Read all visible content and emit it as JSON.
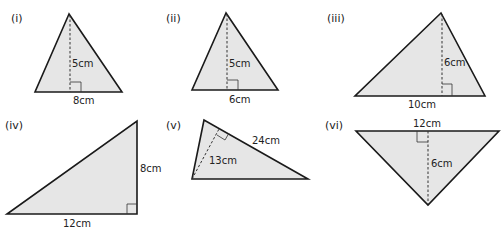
{
  "figures": [
    {
      "id": "i",
      "label": "(i)",
      "base_label": "8cm",
      "height_label": "5cm"
    },
    {
      "id": "ii",
      "label": "(ii)",
      "base_label": "6cm",
      "height_label": "5cm"
    },
    {
      "id": "iii",
      "label": "(iii)",
      "base_label": "10cm",
      "height_label": "6cm"
    },
    {
      "id": "iv",
      "label": "(iv)",
      "base_label": "12cm",
      "height_label": "8cm"
    },
    {
      "id": "v",
      "label": "(v)",
      "base_label": "24cm",
      "height_label": "13cm"
    },
    {
      "id": "vi",
      "label": "(vi)",
      "base_label": "12cm",
      "height_label": "6cm"
    }
  ],
  "colors": {
    "fill": "#e6e6e6",
    "stroke": "#1a1a1a"
  }
}
